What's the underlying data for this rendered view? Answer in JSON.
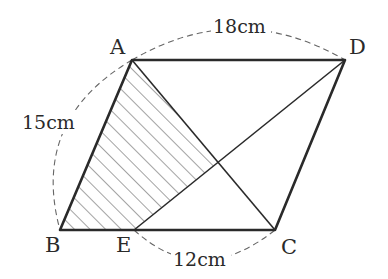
{
  "figure": {
    "type": "parallelogram",
    "vertices": {
      "A": {
        "label": "A",
        "x": 132,
        "y": 60
      },
      "B": {
        "label": "B",
        "x": 60,
        "y": 230
      },
      "C": {
        "label": "C",
        "x": 275,
        "y": 230
      },
      "D": {
        "label": "D",
        "x": 345,
        "y": 60
      },
      "E": {
        "label": "E",
        "x": 134,
        "y": 230
      }
    },
    "measurements": {
      "AD": "18cm",
      "AB": "15cm",
      "EC": "12cm"
    },
    "segments": [
      "AB",
      "BC",
      "CD",
      "DA",
      "AC",
      "ED"
    ],
    "shaded_region": "A-B-E-(AC∩ED)",
    "colors": {
      "stroke": "#2a2a2a",
      "hatch": "#555555",
      "dash": "#666666"
    }
  }
}
